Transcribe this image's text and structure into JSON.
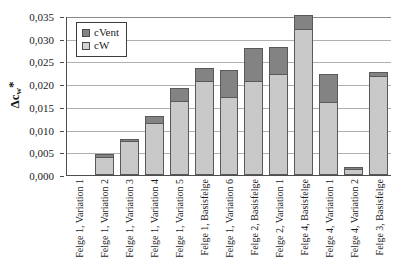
{
  "chart_data": {
    "type": "bar",
    "subtype": "stacked-bar",
    "title": "",
    "xlabel": "",
    "ylabel": "Δcw*",
    "ylim": [
      0,
      0.035
    ],
    "ytick_labels": [
      "0,035",
      "0,030",
      "0,025",
      "0,020",
      "0,015",
      "0,010",
      "0,005",
      "0,000"
    ],
    "ytick_values": [
      0.035,
      0.03,
      0.025,
      0.02,
      0.015,
      0.01,
      0.005,
      0.0
    ],
    "grid": true,
    "legend_position": "top-left-inside",
    "decimal_separator": ",",
    "categories": [
      "Felge 1, Variation 1",
      "Felge 1, Variation 2",
      "Felge 1, Variation 3",
      "Felge 1, Variation 4",
      "Felge 1, Variation 5",
      "Felge 1, Basisfelge",
      "Felge 1, Variation 6",
      "Felge 2, Basisfelge",
      "Felge 2, Variation 1",
      "Felge 4, Basisfelge",
      "Felge 4, Variation 1",
      "Felge 4, Variation 2",
      "Felge 3, Basisfelge"
    ],
    "series": [
      {
        "name": "cW",
        "color": "#c9c9c9",
        "values": [
          0.0,
          0.0039,
          0.0074,
          0.0114,
          0.0162,
          0.0208,
          0.0172,
          0.0206,
          0.0222,
          0.0321,
          0.016,
          0.0013,
          0.0218
        ]
      },
      {
        "name": "cVent",
        "color": "#838383",
        "values": [
          0.0,
          0.0007,
          0.0006,
          0.0016,
          0.0029,
          0.0027,
          0.0059,
          0.0074,
          0.006,
          0.0031,
          0.0062,
          0.0004,
          0.0008
        ]
      }
    ],
    "totals": [
      0.0,
      0.0046,
      0.008,
      0.013,
      0.0191,
      0.0235,
      0.0231,
      0.028,
      0.0282,
      0.0352,
      0.0222,
      0.0017,
      0.0226
    ]
  },
  "legend": {
    "items": [
      {
        "label": "cVent",
        "color": "#838383"
      },
      {
        "label": "cW",
        "color": "#d4d4d4"
      }
    ]
  }
}
